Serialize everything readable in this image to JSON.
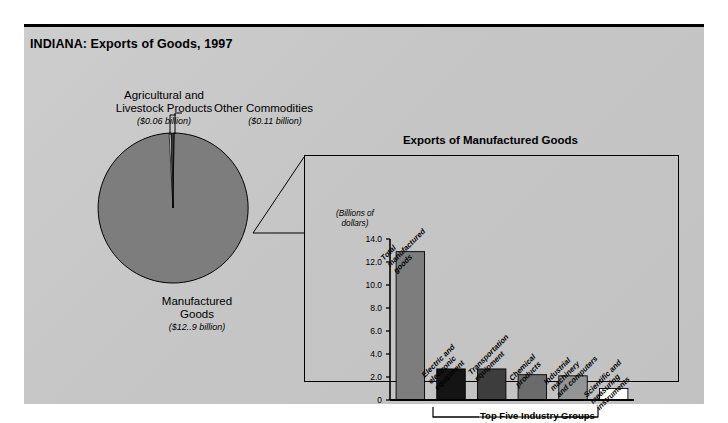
{
  "title": "INDIANA: Exports of Goods, 1997",
  "pie": {
    "slices": [
      {
        "name": "Agricultural and\nLivestock Products",
        "line1": "Agricultural and",
        "line2": "Livestock Products",
        "value_label": "($0.06 billion)",
        "value": 0.06,
        "color": "#ffffff"
      },
      {
        "name": "Other Commodities",
        "line1": "Other Commodities",
        "line2": "",
        "value_label": "($0.11 billion)",
        "value": 0.11,
        "color": "#3a3a3a"
      },
      {
        "name": "Manufactured\nGoods",
        "line1": "Manufactured",
        "line2": "Goods",
        "value_label": "($12..9 billion)",
        "value": 12.9,
        "color": "#7d7d7d"
      }
    ]
  },
  "bar_panel": {
    "title": "Exports of Manufactured Goods",
    "axis_caption_line1": "(Billions of",
    "axis_caption_line2": "dollars)",
    "group_bracket_label": "Top Five Industry Groups"
  },
  "chart_data": {
    "type": "bar",
    "title": "Exports of Manufactured Goods",
    "xlabel": "Top Five Industry Groups",
    "ylabel": "(Billions of dollars)",
    "ylim": [
      0,
      14
    ],
    "grid": false,
    "legend": "none",
    "tick_labels": [
      "14.0",
      "12.0",
      "10.0",
      "8.0",
      "6.0",
      "4.0",
      "2.0",
      "0"
    ],
    "ticks": [
      14.0,
      12.0,
      10.0,
      8.0,
      6.0,
      4.0,
      2.0,
      0
    ],
    "categories": [
      "Total manufactured goods",
      "Electric and electronic equipment",
      "Transportation equipment",
      "Chemical products",
      "Industrial machinery and computers",
      "Scientific and measuring instruments"
    ],
    "category_lines": [
      [
        "Total",
        "manufactured",
        "goods"
      ],
      [
        "Electric and",
        "electronic",
        "equipment"
      ],
      [
        "Transportation",
        "equipment"
      ],
      [
        "Chemical",
        "products"
      ],
      [
        "Industrial",
        "machinery",
        "and computers"
      ],
      [
        "Scientific and",
        "measuring",
        "instruments"
      ]
    ],
    "values": [
      12.9,
      2.7,
      2.7,
      2.2,
      2.1,
      1.0
    ],
    "colors": [
      "#7d7d7d",
      "#141414",
      "#3d3d3d",
      "#6b6b6b",
      "#949494",
      "#ffffff"
    ]
  },
  "pie_chart_data": {
    "type": "pie",
    "title": "INDIANA: Exports of Goods, 1997",
    "labels": [
      "Manufactured Goods",
      "Other Commodities",
      "Agricultural and Livestock Products"
    ],
    "values": [
      12.9,
      0.11,
      0.06
    ],
    "unit": "billions of dollars",
    "colors": [
      "#7d7d7d",
      "#3a3a3a",
      "#ffffff"
    ]
  }
}
